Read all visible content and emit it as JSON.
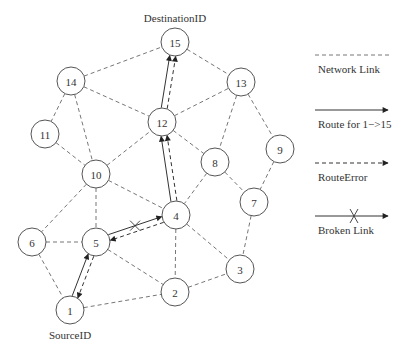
{
  "diagram": {
    "title_destination": "DestinationID",
    "title_source": "SourceID",
    "nodes": [
      {
        "id": "1",
        "label": "1",
        "x": 70,
        "y": 310
      },
      {
        "id": "2",
        "label": "2",
        "x": 175,
        "y": 292
      },
      {
        "id": "3",
        "label": "3",
        "x": 240,
        "y": 269
      },
      {
        "id": "4",
        "label": "4",
        "x": 176,
        "y": 215
      },
      {
        "id": "5",
        "label": "5",
        "x": 96,
        "y": 242
      },
      {
        "id": "6",
        "label": "6",
        "x": 32,
        "y": 242
      },
      {
        "id": "7",
        "label": "7",
        "x": 254,
        "y": 202
      },
      {
        "id": "8",
        "label": "8",
        "x": 215,
        "y": 162
      },
      {
        "id": "9",
        "label": "9",
        "x": 280,
        "y": 149
      },
      {
        "id": "10",
        "label": "10",
        "x": 96,
        "y": 174
      },
      {
        "id": "11",
        "label": "11",
        "x": 45,
        "y": 134
      },
      {
        "id": "12",
        "label": "12",
        "x": 162,
        "y": 122
      },
      {
        "id": "13",
        "label": "13",
        "x": 241,
        "y": 82
      },
      {
        "id": "14",
        "label": "14",
        "x": 71,
        "y": 81
      },
      {
        "id": "15",
        "label": "15",
        "x": 175,
        "y": 42
      }
    ],
    "network_links": [
      [
        "14",
        "15"
      ],
      [
        "15",
        "13"
      ],
      [
        "14",
        "12"
      ],
      [
        "12",
        "13"
      ],
      [
        "14",
        "11"
      ],
      [
        "14",
        "10"
      ],
      [
        "11",
        "10"
      ],
      [
        "10",
        "12"
      ],
      [
        "12",
        "8"
      ],
      [
        "13",
        "8"
      ],
      [
        "13",
        "9"
      ],
      [
        "9",
        "7"
      ],
      [
        "8",
        "7"
      ],
      [
        "8",
        "4"
      ],
      [
        "10",
        "4"
      ],
      [
        "10",
        "5"
      ],
      [
        "10",
        "6"
      ],
      [
        "6",
        "5"
      ],
      [
        "6",
        "1"
      ],
      [
        "5",
        "2"
      ],
      [
        "1",
        "2"
      ],
      [
        "4",
        "2"
      ],
      [
        "4",
        "3"
      ],
      [
        "2",
        "3"
      ],
      [
        "7",
        "3"
      ]
    ],
    "route_links": [
      [
        "1",
        "5"
      ],
      [
        "4",
        "12"
      ],
      [
        "12",
        "15"
      ]
    ],
    "route_error_links": [
      [
        "5",
        "1"
      ],
      [
        "4",
        "5"
      ],
      [
        "4",
        "12"
      ],
      [
        "12",
        "15"
      ]
    ],
    "broken_links": [
      [
        "5",
        "4"
      ]
    ]
  },
  "legend": {
    "items": [
      {
        "type": "network-link",
        "label": "Network Link"
      },
      {
        "type": "route",
        "label": "Route for 1−>15"
      },
      {
        "type": "route-error",
        "label": "RouteError"
      },
      {
        "type": "broken-link",
        "label": "Broken Link"
      }
    ]
  },
  "colors": {
    "line": "#333333",
    "dashed": "#666666",
    "node_stroke": "#555555",
    "background": "#ffffff"
  }
}
